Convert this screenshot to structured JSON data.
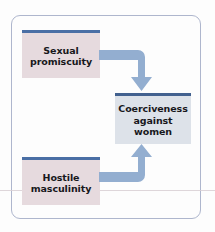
{
  "diagram": {
    "frame": {
      "border_color": "#aeb6cd"
    },
    "nodes": [
      {
        "id": "sexual-promiscuity",
        "label": "Sexual\npromiscuity",
        "fill": "#e6dade",
        "cap_color": "#4a6fa5"
      },
      {
        "id": "coerciveness",
        "label": "Coerciveness\nagainst\nwomen",
        "fill": "#dde2e9",
        "cap_color": "#42618f"
      },
      {
        "id": "hostile-masculinity",
        "label": "Hostile\nmasculinity",
        "fill": "#e6dade",
        "cap_color": "#4a6fa5"
      }
    ],
    "arrows": [
      {
        "id": "arrow-top",
        "from": "sexual-promiscuity",
        "to": "coerciveness",
        "shape": "elbow-right-then-down",
        "color": "#93aed0"
      },
      {
        "id": "arrow-bottom",
        "from": "hostile-masculinity",
        "to": "coerciveness",
        "shape": "elbow-right-then-up",
        "color": "#93aed0"
      }
    ]
  }
}
